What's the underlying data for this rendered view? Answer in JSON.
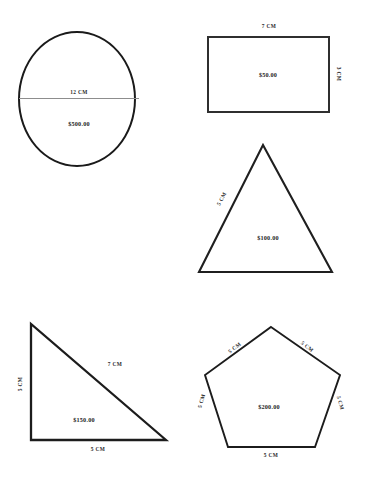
{
  "page": {
    "background": "#ffffff",
    "stroke_color": "#1a1a1a",
    "text_color": "#2b2b2b"
  },
  "shapes": [
    {
      "name": "circle",
      "kind": "circle",
      "price": "$500.00",
      "dimensions": [
        {
          "label": "12 CM",
          "edge": "diameter"
        }
      ]
    },
    {
      "name": "rectangle",
      "kind": "rectangle",
      "price": "$50.00",
      "dimensions": [
        {
          "label": "7 CM",
          "edge": "top"
        },
        {
          "label": "3 CM",
          "edge": "right"
        }
      ]
    },
    {
      "name": "triangle",
      "kind": "equilateral-triangle",
      "price": "$100.00",
      "dimensions": [
        {
          "label": "5 CM",
          "edge": "left"
        }
      ]
    },
    {
      "name": "right-triangle",
      "kind": "right-triangle",
      "price": "$150.00",
      "dimensions": [
        {
          "label": "5 CM",
          "edge": "left"
        },
        {
          "label": "7 CM",
          "edge": "hypotenuse"
        },
        {
          "label": "5 CM",
          "edge": "bottom"
        }
      ]
    },
    {
      "name": "pentagon",
      "kind": "pentagon",
      "price": "$200.00",
      "dimensions": [
        {
          "label": "5 CM",
          "edge": "upper-left"
        },
        {
          "label": "5 CM",
          "edge": "upper-right"
        },
        {
          "label": "5 CM",
          "edge": "left"
        },
        {
          "label": "5 CM",
          "edge": "right"
        },
        {
          "label": "5 CM",
          "edge": "bottom"
        }
      ]
    }
  ]
}
